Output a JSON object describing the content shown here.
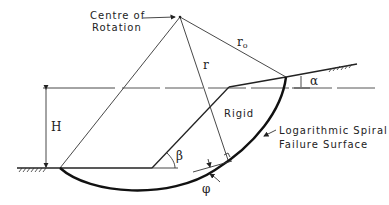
{
  "diagram": {
    "labels": {
      "centre_line1": "Centre of",
      "centre_line2": "Rotation",
      "r0": "r",
      "r0_sub": "o",
      "r": "r",
      "rigid": "Rigid",
      "failure_line1": "Logarithmic  Spiral",
      "failure_line2": "Failure  Surface",
      "height": "H",
      "alpha": "α",
      "beta": "β",
      "phi": "φ"
    },
    "colors": {
      "line": "#222222",
      "background": "#ffffff"
    }
  }
}
